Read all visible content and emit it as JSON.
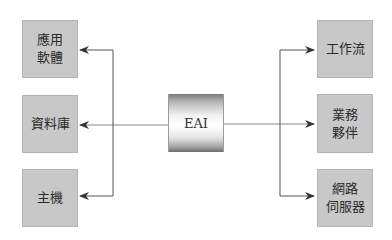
{
  "diagram": {
    "hub": {
      "label": "EAI"
    },
    "left_nodes": [
      {
        "label": "應用\n軟體"
      },
      {
        "label": "資料庫"
      },
      {
        "label": "主機"
      }
    ],
    "right_nodes": [
      {
        "label": "工作流"
      },
      {
        "label": "業務\n夥伴"
      },
      {
        "label": "網路\n伺服器"
      }
    ],
    "colors": {
      "node_fill": "#c8c8c8",
      "line": "#555555"
    }
  }
}
